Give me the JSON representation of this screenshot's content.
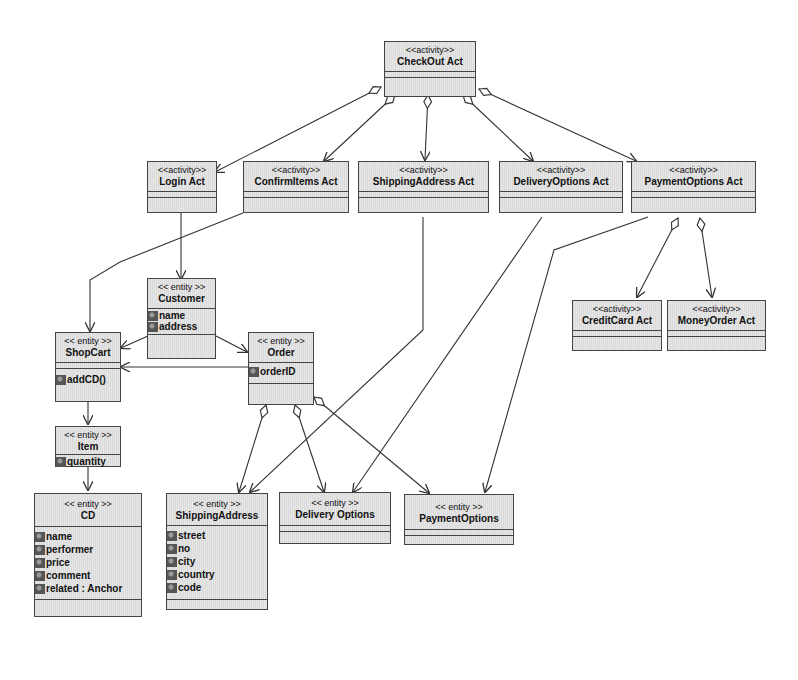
{
  "diagram": {
    "type": "UML class diagram",
    "nodes": [
      {
        "id": "checkout",
        "stereotype": "<<activity>>",
        "name": "CheckOut Act",
        "attributes": [],
        "operations": []
      },
      {
        "id": "login",
        "stereotype": "<<activity>>",
        "name": "Login Act",
        "attributes": [],
        "operations": []
      },
      {
        "id": "confirm",
        "stereotype": "<<activity>>",
        "name": "ConfirmItems Act",
        "attributes": [],
        "operations": []
      },
      {
        "id": "shipact",
        "stereotype": "<<activity>>",
        "name": "ShippingAddress Act",
        "attributes": [],
        "operations": []
      },
      {
        "id": "delivact",
        "stereotype": "<<activity>>",
        "name": "DeliveryOptions Act",
        "attributes": [],
        "operations": []
      },
      {
        "id": "payact",
        "stereotype": "<<activity>>",
        "name": "PaymentOptions Act",
        "attributes": [],
        "operations": []
      },
      {
        "id": "credit",
        "stereotype": "<<activity>>",
        "name": "CreditCard Act",
        "attributes": [],
        "operations": []
      },
      {
        "id": "money",
        "stereotype": "<<activity>>",
        "name": "MoneyOrder Act",
        "attributes": [],
        "operations": []
      },
      {
        "id": "customer",
        "stereotype": "<< entity >>",
        "name": "Customer",
        "attributes": [
          "name",
          "address"
        ],
        "operations": []
      },
      {
        "id": "shopcart",
        "stereotype": "<< entity >>",
        "name": "ShopCart",
        "attributes": [],
        "operations": [
          "addCD()"
        ]
      },
      {
        "id": "order",
        "stereotype": "<< entity >>",
        "name": "Order",
        "attributes": [
          "orderID"
        ],
        "operations": []
      },
      {
        "id": "item",
        "stereotype": "<< entity >>",
        "name": "Item",
        "attributes": [
          "quantity"
        ],
        "operations": []
      },
      {
        "id": "cd",
        "stereotype": "<< entity >>",
        "name": "CD",
        "attributes": [
          "name",
          "performer",
          "price",
          "comment",
          "related : Anchor"
        ],
        "operations": []
      },
      {
        "id": "shipaddr",
        "stereotype": "<< entity >>",
        "name": "ShippingAddress",
        "attributes": [
          "street",
          "no",
          "city",
          "country",
          "code"
        ],
        "operations": []
      },
      {
        "id": "delivopt",
        "stereotype": "<< entity >>",
        "name": "Delivery Options",
        "attributes": [],
        "operations": []
      },
      {
        "id": "payopt",
        "stereotype": "<< entity >>",
        "name": "PaymentOptions",
        "attributes": [],
        "operations": []
      }
    ],
    "edges": [
      {
        "from": "checkout",
        "to": "login",
        "type": "aggregation"
      },
      {
        "from": "checkout",
        "to": "confirm",
        "type": "aggregation"
      },
      {
        "from": "checkout",
        "to": "shipact",
        "type": "aggregation"
      },
      {
        "from": "checkout",
        "to": "delivact",
        "type": "aggregation"
      },
      {
        "from": "checkout",
        "to": "payact",
        "type": "aggregation"
      },
      {
        "from": "payact",
        "to": "credit",
        "type": "aggregation"
      },
      {
        "from": "payact",
        "to": "money",
        "type": "aggregation"
      },
      {
        "from": "login",
        "to": "customer",
        "type": "association"
      },
      {
        "from": "confirm",
        "to": "shopcart",
        "type": "association"
      },
      {
        "from": "customer",
        "to": "shopcart",
        "type": "association"
      },
      {
        "from": "customer",
        "to": "order",
        "type": "association"
      },
      {
        "from": "order",
        "to": "shopcart",
        "type": "association"
      },
      {
        "from": "shopcart",
        "to": "item",
        "type": "association"
      },
      {
        "from": "item",
        "to": "cd",
        "type": "association"
      },
      {
        "from": "order",
        "to": "shipaddr",
        "type": "aggregation"
      },
      {
        "from": "order",
        "to": "delivopt",
        "type": "aggregation"
      },
      {
        "from": "order",
        "to": "payopt",
        "type": "aggregation"
      },
      {
        "from": "shipact",
        "to": "shipaddr",
        "type": "association"
      },
      {
        "from": "delivact",
        "to": "delivopt",
        "type": "association"
      },
      {
        "from": "payact",
        "to": "payopt",
        "type": "association"
      }
    ]
  },
  "colors": {
    "box_fill": "#e6e6e6",
    "box_border": "#444444",
    "line": "#333333",
    "attribute_icon": "#555555"
  }
}
